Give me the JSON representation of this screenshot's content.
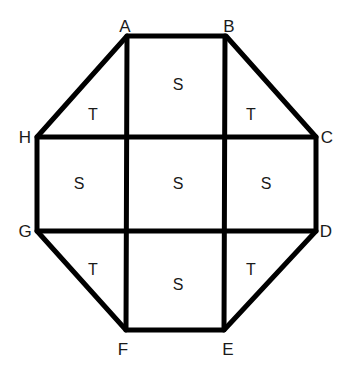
{
  "diagram": {
    "type": "octagon-dissection",
    "vertices": [
      {
        "label": "A",
        "x": 127,
        "y": 36,
        "lx": 125,
        "ly": 32
      },
      {
        "label": "B",
        "x": 226,
        "y": 36,
        "lx": 229,
        "ly": 32
      },
      {
        "label": "C",
        "x": 316,
        "y": 137,
        "lx": 327,
        "ly": 143
      },
      {
        "label": "D",
        "x": 316,
        "y": 231,
        "lx": 326,
        "ly": 237
      },
      {
        "label": "E",
        "x": 224,
        "y": 330,
        "lx": 228,
        "ly": 355
      },
      {
        "label": "F",
        "x": 126,
        "y": 330,
        "lx": 123,
        "ly": 355
      },
      {
        "label": "G",
        "x": 37,
        "y": 231,
        "lx": 25,
        "ly": 237
      },
      {
        "label": "H",
        "x": 37,
        "y": 137,
        "lx": 25,
        "ly": 143
      }
    ],
    "regions": [
      {
        "label": "S",
        "x": 178,
        "y": 86
      },
      {
        "label": "T",
        "x": 93,
        "y": 116
      },
      {
        "label": "T",
        "x": 251,
        "y": 116
      },
      {
        "label": "S",
        "x": 79,
        "y": 185
      },
      {
        "label": "S",
        "x": 178,
        "y": 185
      },
      {
        "label": "S",
        "x": 266,
        "y": 185
      },
      {
        "label": "T",
        "x": 93,
        "y": 271
      },
      {
        "label": "T",
        "x": 251,
        "y": 271
      },
      {
        "label": "S",
        "x": 178,
        "y": 286
      }
    ],
    "grid": {
      "vertical_x": [
        127,
        225
      ],
      "horizontal_y": [
        137,
        231
      ]
    },
    "colors": {
      "stroke": "#000000",
      "text": "#1a1a1a",
      "background": "#ffffff"
    }
  }
}
